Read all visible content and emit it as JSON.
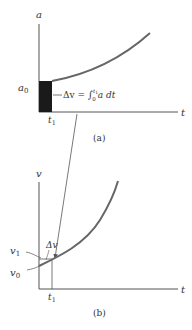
{
  "top_graph": {
    "caption": "(a)",
    "y_axis_label": "a",
    "x_axis_label": "t",
    "y_tick_label": "a",
    "y_tick_sub": "0",
    "x_tick_label": "t",
    "x_tick_sub": "1",
    "area_annotation": {
      "delta": "Δv = ",
      "integral": "∫",
      "upper": "t",
      "upper_sub": "1",
      "lower": "0",
      "integrand": "a dt"
    }
  },
  "bottom_graph": {
    "caption": "(b)",
    "y_axis_label": "v",
    "x_axis_label": "t",
    "y_tick_v1": "v",
    "y_tick_v1_sub": "1",
    "y_tick_v0": "v",
    "y_tick_v0_sub": "0",
    "x_tick_label": "t",
    "x_tick_sub": "1",
    "delta_label": "Δv"
  },
  "colors": {
    "axis": "#555555",
    "curve": "#666666",
    "area_fill": "#1a1a1a",
    "text": "#333333"
  }
}
